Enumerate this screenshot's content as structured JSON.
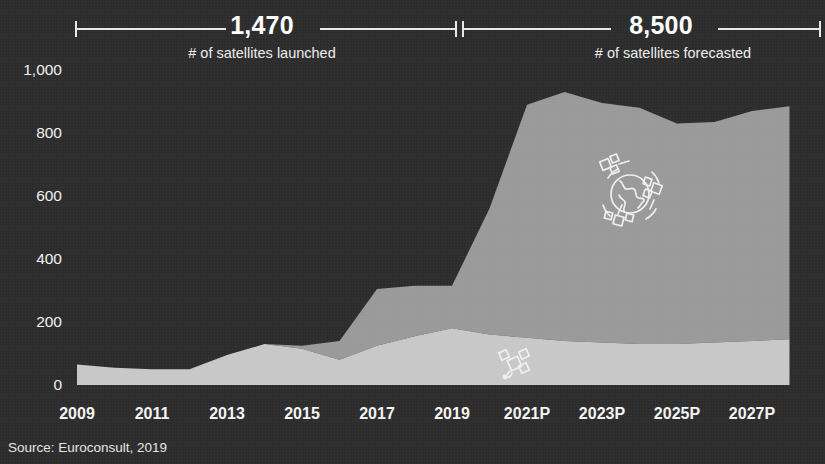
{
  "background_color": "#2e2d2d",
  "header": {
    "left_bracket": {
      "value": "1,470",
      "caption": "# of satellites launched"
    },
    "right_bracket": {
      "value": "8,500",
      "caption": "# of satellites forecasted"
    }
  },
  "source_note": "Source: Euroconsult, 2019",
  "legend": [
    {
      "key": "constellations",
      "label": "Constellations",
      "icon": "globe-constellation-icon",
      "color": "#9a9a9a"
    },
    {
      "key": "single",
      "label": "Single-satellite missions",
      "icon": "satellite-icon",
      "color": "#c8c8c8"
    }
  ],
  "chart_data": {
    "type": "area",
    "stacked": true,
    "title": "",
    "subtitle": "",
    "xlabel": "",
    "ylabel": "",
    "grid": false,
    "legend_position": "inline",
    "ylim": [
      0,
      1000
    ],
    "yticks": [
      "0",
      "200",
      "400",
      "600",
      "800",
      "1,000"
    ],
    "ytick_values": [
      0,
      200,
      400,
      600,
      800,
      1000
    ],
    "xticks": [
      "2009",
      "2011",
      "2013",
      "2015",
      "2017",
      "2019",
      "2021P",
      "2023P",
      "2025P",
      "2027P"
    ],
    "x": [
      2009,
      2010,
      2011,
      2012,
      2013,
      2014,
      2015,
      2016,
      2017,
      2018,
      2019,
      2020,
      2021,
      2022,
      2023,
      2024,
      2025,
      2026,
      2027,
      2028
    ],
    "x_labels": [
      "2009",
      "2010",
      "2011",
      "2012",
      "2013",
      "2014",
      "2015",
      "2016",
      "2017",
      "2018",
      "2019",
      "2020",
      "2021P",
      "2022P",
      "2023P",
      "2024P",
      "2025P",
      "2026P",
      "2027P",
      "2028P"
    ],
    "series": [
      {
        "name": "Single-satellite missions",
        "color": "#c8c8c8",
        "values": [
          65,
          55,
          50,
          50,
          95,
          130,
          115,
          80,
          125,
          155,
          180,
          160,
          150,
          140,
          135,
          130,
          130,
          135,
          140,
          145
        ]
      },
      {
        "name": "Constellations",
        "color": "#9a9a9a",
        "values": [
          0,
          0,
          0,
          0,
          0,
          0,
          10,
          60,
          180,
          160,
          135,
          400,
          740,
          790,
          760,
          750,
          700,
          700,
          730,
          740
        ]
      }
    ],
    "totals": [
      65,
      55,
      50,
      50,
      95,
      130,
      125,
      140,
      305,
      315,
      315,
      560,
      890,
      930,
      895,
      880,
      830,
      835,
      870,
      885
    ]
  }
}
